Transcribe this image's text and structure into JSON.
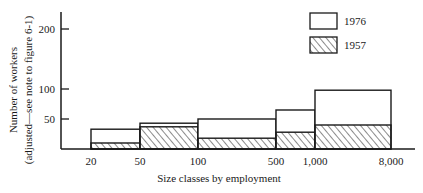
{
  "chart_data": {
    "type": "bar",
    "subtype": "histogram-overlay",
    "title": "",
    "xlabel": "Size classes by employment",
    "ylabel": "Number of workers",
    "ylabel_note": "(adjusted—see note to figure 6-1)",
    "ylim": [
      0,
      230
    ],
    "yticks": [
      50,
      100,
      200
    ],
    "xticks": [
      "20",
      "50",
      "100",
      "500",
      "1,000",
      "8,000"
    ],
    "grid": false,
    "legend_position": "top-right",
    "bins": [
      {
        "from": "20",
        "to": "50"
      },
      {
        "from": "50",
        "to": "100"
      },
      {
        "from": "100",
        "to": "500"
      },
      {
        "from": "500",
        "to": "1,000"
      },
      {
        "from": "1,000",
        "to": "8,000"
      }
    ],
    "categories": [
      "20-50",
      "50-100",
      "100-500",
      "500-1,000",
      "1,000-8,000"
    ],
    "series": [
      {
        "name": "1976",
        "style": "open",
        "values": [
          33,
          43,
          50,
          65,
          98
        ]
      },
      {
        "name": "1957",
        "style": "hatched",
        "values": [
          10,
          37,
          18,
          28,
          40
        ]
      }
    ]
  },
  "legend": {
    "items": [
      {
        "label": "1976",
        "style": "open"
      },
      {
        "label": "1957",
        "style": "hatched"
      }
    ]
  },
  "colors": {
    "ink": "#1a1a1a",
    "background": "#ffffff"
  }
}
